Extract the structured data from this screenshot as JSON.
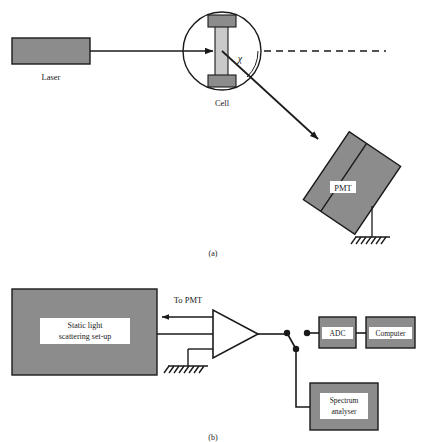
{
  "figure": {
    "title_hidden": "Light scattering apparatus schematic",
    "panel_a_caption": "(a)",
    "panel_b_caption": "(b)"
  },
  "colors": {
    "device_fill": "#8c8c8c",
    "cell_tube_fill": "#c9c9c9",
    "cell_cap_fill": "#8c8c8c",
    "stroke": "#1a1a1a",
    "label_bg": "#ffffff",
    "page_bg": "#ffffff"
  },
  "panel_a": {
    "laser": {
      "label": "Laser"
    },
    "cell": {
      "label": "Cell"
    },
    "angle": {
      "symbol": "χ"
    },
    "pmt": {
      "label": "PMT"
    },
    "beam": {
      "incident": "incident-beam",
      "scattered": "scattered-beam",
      "reference": "transmitted-reference-dashed"
    },
    "ground": {
      "name": "pmt-ground-symbol"
    }
  },
  "panel_b": {
    "static_setup": {
      "line1": "Static light",
      "line2": "scattering set-up"
    },
    "to_pmt": {
      "label": "To PMT"
    },
    "amplifier": {
      "name": "amplifier-triangle"
    },
    "ground": {
      "name": "amplifier-ground-symbol"
    },
    "switch": {
      "name": "selector-switch"
    },
    "adc": {
      "label": "ADC"
    },
    "computer": {
      "label": "Computer"
    },
    "spectrum_analyser": {
      "line1": "Spectrum",
      "line2": "analyser"
    }
  }
}
